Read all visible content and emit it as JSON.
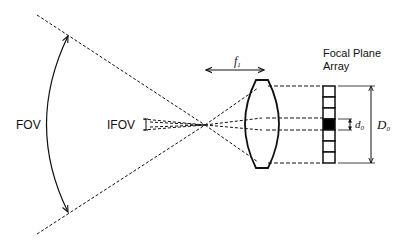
{
  "diagram": {
    "type": "optical-schematic",
    "labels": {
      "fov": "FOV",
      "ifov": "IFOV",
      "focal_length": {
        "base": "f",
        "sub": "1"
      },
      "focal_plane_array": [
        "Focal Plane",
        "Array"
      ],
      "detector_pitch": {
        "base": "d",
        "sub": "0"
      },
      "array_size": {
        "base": "D",
        "sub": "0"
      }
    },
    "array": {
      "cells": 7,
      "highlighted_cell": 4
    },
    "colors": {
      "line": "#111111",
      "background": "#ffffff",
      "detector_fill": "#000000"
    }
  }
}
